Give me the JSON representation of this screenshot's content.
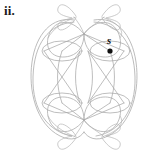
{
  "figure": {
    "label": "ii.",
    "background_color": "#ffffff",
    "stroke_color": "#a8a8a8",
    "marker_color": "#111111"
  },
  "vertices": [
    {
      "id": "s",
      "label": "s",
      "x": 110,
      "y": 51,
      "label_x": 107,
      "label_y": 36,
      "marked": true,
      "marker_radius": 2.6
    }
  ],
  "diagram": {
    "type": "graph-drawing",
    "symmetry": "bilateral-vertical-and-horizontal",
    "hub_points": [
      {
        "x": 84,
        "y": 34
      },
      {
        "x": 84,
        "y": 120
      },
      {
        "x": 62,
        "y": 51
      },
      {
        "x": 110,
        "y": 51
      },
      {
        "x": 62,
        "y": 103
      },
      {
        "x": 110,
        "y": 103
      }
    ]
  }
}
